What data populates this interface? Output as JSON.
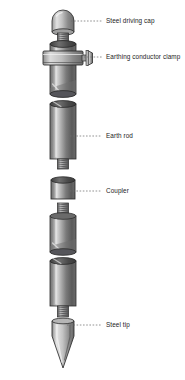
{
  "diagram": {
    "background_color": "#ffffff",
    "metal_light": "#d8d8d8",
    "metal_mid": "#8f8f8f",
    "metal_dark": "#4a4a4a",
    "outline_color": "#2b2b2b",
    "leader_color": "#6e6e6e",
    "text_color": "#1c1c1c",
    "labels": [
      {
        "id": "steel-driving-cap",
        "text": "Steel driving cap",
        "x": 106,
        "y": 21
      },
      {
        "id": "earthing-conductor-clamp",
        "text": "Earthing conductor clamp",
        "x": 106,
        "y": 57
      },
      {
        "id": "earth-rod",
        "text": "Earth rod",
        "x": 106,
        "y": 136
      },
      {
        "id": "coupler",
        "text": "Coupler",
        "x": 106,
        "y": 191
      },
      {
        "id": "steel-tip",
        "text": "Steel tip",
        "x": 106,
        "y": 325
      }
    ],
    "leaders": [
      {
        "id": "leader-steel-driving-cap",
        "x1": 71,
        "y1": 21,
        "x2": 102,
        "y2": 21
      },
      {
        "id": "leader-earthing-conductor-clamp",
        "x1": 84,
        "y1": 57,
        "x2": 102,
        "y2": 57
      },
      {
        "id": "leader-earth-rod",
        "x1": 70,
        "y1": 136,
        "x2": 102,
        "y2": 136
      },
      {
        "id": "leader-coupler",
        "x1": 70,
        "y1": 191,
        "x2": 102,
        "y2": 191
      },
      {
        "id": "leader-steel-tip",
        "x1": 67,
        "y1": 325,
        "x2": 102,
        "y2": 325
      }
    ],
    "parts": [
      {
        "id": "steel-driving-cap",
        "name": "Steel driving cap",
        "top": 10,
        "bottom": 34
      },
      {
        "id": "cap-thread",
        "name": "Cap thread",
        "top": 31,
        "bottom": 42
      },
      {
        "id": "upper-rod",
        "name": "Upper earth rod",
        "top": 42,
        "bottom": 95
      },
      {
        "id": "earthing-conductor-clamp",
        "name": "Earthing conductor clamp",
        "top": 49,
        "bottom": 66
      },
      {
        "id": "earth-rod-second",
        "name": "Earth rod",
        "top": 101,
        "bottom": 166
      },
      {
        "id": "coupler",
        "name": "Coupler",
        "top": 178,
        "bottom": 199
      },
      {
        "id": "earth-rod-third",
        "name": "Earth rod",
        "top": 203,
        "bottom": 252
      },
      {
        "id": "earth-rod-fourth",
        "name": "Earth rod",
        "top": 258,
        "bottom": 306
      },
      {
        "id": "steel-tip",
        "name": "Steel tip",
        "top": 312,
        "bottom": 368
      }
    ]
  }
}
